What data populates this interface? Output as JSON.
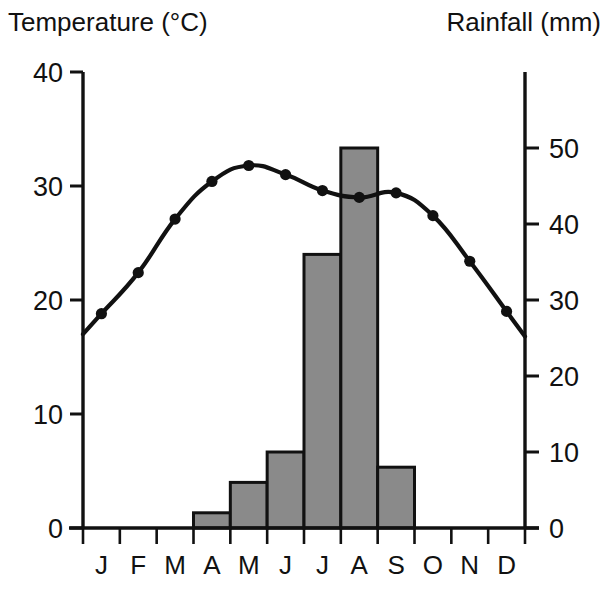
{
  "figure": {
    "left_axis_title": "Temperature (°C)",
    "right_axis_title": "Rainfall (mm)",
    "bar_fill_color": "#8a8a8a",
    "line_color": "#111111",
    "background_color": "#ffffff"
  },
  "chart_data": {
    "type": "bar",
    "title": "",
    "subtitle": "",
    "categories": [
      "J",
      "F",
      "M",
      "A",
      "M",
      "J",
      "J",
      "A",
      "S",
      "O",
      "N",
      "D"
    ],
    "month_labels": [
      "J",
      "F",
      "M",
      "A",
      "M",
      "J",
      "J",
      "A",
      "S",
      "O",
      "N",
      "D"
    ],
    "series": [
      {
        "name": "Rainfall (mm)",
        "type": "bar",
        "axis": "right",
        "color": "#8a8a8a",
        "values": [
          0,
          0,
          0,
          2,
          6,
          10,
          36,
          50,
          8,
          0,
          0,
          0
        ]
      },
      {
        "name": "Temperature (°C)",
        "type": "line",
        "axis": "left",
        "color": "#111111",
        "values": [
          18.8,
          22.4,
          27.1,
          30.4,
          31.8,
          31.0,
          29.6,
          29.0,
          29.4,
          27.4,
          23.4,
          19.0
        ]
      }
    ],
    "xlabel": "",
    "ylabel": "Temperature (°C)",
    "y2label": "Rainfall (mm)",
    "ylim": [
      0,
      40
    ],
    "y2lim": [
      0,
      60
    ],
    "yticks": [
      0,
      10,
      20,
      30,
      40
    ],
    "y2ticks": [
      0,
      10,
      20,
      30,
      40,
      50
    ],
    "ytick_labels": [
      "0",
      "10",
      "20",
      "30",
      "40"
    ],
    "y2tick_labels": [
      "0",
      "10",
      "20",
      "30",
      "40",
      "50"
    ],
    "grid": false,
    "legend": "none"
  }
}
